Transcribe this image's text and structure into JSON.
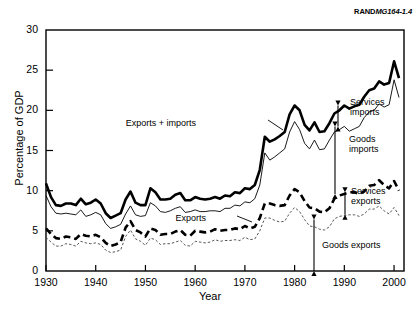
{
  "figure": {
    "source_label": "RANDMG164-1.4",
    "source_label_bold": "RAND",
    "source_label_italic": "MG164-1.4"
  },
  "chart_data": {
    "type": "line",
    "title": "",
    "xlabel": "Year",
    "ylabel": "Percentage of GDP",
    "xlim": [
      1930,
      2002
    ],
    "ylim": [
      0,
      30
    ],
    "yticks": [
      0,
      5,
      10,
      15,
      20,
      25,
      30
    ],
    "xticks": [
      1930,
      1940,
      1950,
      1960,
      1970,
      1980,
      1990,
      2000
    ],
    "ytick_labels": [
      "0",
      "5",
      "10",
      "15",
      "20",
      "25",
      "30"
    ],
    "xtick_labels": [
      "1930",
      "1940",
      "1950",
      "1960",
      "1970",
      "1980",
      "1990",
      "2000"
    ],
    "grid": false,
    "legend_position": "inline-annotations",
    "x": [
      1930,
      1931,
      1932,
      1933,
      1934,
      1935,
      1936,
      1937,
      1938,
      1939,
      1940,
      1941,
      1942,
      1943,
      1944,
      1945,
      1946,
      1947,
      1948,
      1949,
      1950,
      1951,
      1952,
      1953,
      1954,
      1955,
      1956,
      1957,
      1958,
      1959,
      1960,
      1961,
      1962,
      1963,
      1964,
      1965,
      1966,
      1967,
      1968,
      1969,
      1970,
      1971,
      1972,
      1973,
      1974,
      1975,
      1976,
      1977,
      1978,
      1979,
      1980,
      1981,
      1982,
      1983,
      1984,
      1985,
      1986,
      1987,
      1988,
      1989,
      1990,
      1991,
      1992,
      1993,
      1994,
      1995,
      1996,
      1997,
      1998,
      1999,
      2000,
      2001
    ],
    "series": [
      {
        "name": "Exports + imports",
        "style": "thick-solid",
        "color": "#000000",
        "values": [
          10.9,
          9.2,
          8.2,
          8.1,
          8.4,
          8.4,
          8.2,
          9.0,
          8.3,
          8.5,
          8.9,
          8.4,
          7.2,
          6.6,
          6.9,
          7.2,
          8.9,
          9.9,
          8.5,
          8.2,
          8.2,
          10.3,
          9.8,
          8.9,
          8.9,
          9.0,
          9.5,
          9.7,
          8.8,
          8.8,
          9.2,
          9.0,
          8.9,
          9.0,
          9.2,
          9.0,
          9.4,
          9.3,
          9.8,
          9.7,
          10.3,
          10.2,
          10.7,
          12.6,
          16.7,
          16.1,
          16.4,
          16.8,
          17.3,
          19.5,
          20.6,
          20.0,
          18.2,
          17.5,
          18.5,
          17.3,
          17.4,
          18.4,
          19.6,
          20.0,
          20.6,
          20.2,
          20.5,
          20.7,
          21.7,
          22.5,
          22.7,
          23.6,
          23.2,
          23.4,
          26.1,
          24.0
        ]
      },
      {
        "name": "Goods + services imports (upper thin line)",
        "style": "thin-solid",
        "color": "#000000",
        "values": [
          9.4,
          8.0,
          7.2,
          7.1,
          7.2,
          7.1,
          7.0,
          7.6,
          6.8,
          7.0,
          7.3,
          7.0,
          5.9,
          5.3,
          5.5,
          5.8,
          7.1,
          8.1,
          7.0,
          6.8,
          6.9,
          8.5,
          8.1,
          7.4,
          7.3,
          7.5,
          7.8,
          8.0,
          7.3,
          7.4,
          7.6,
          7.4,
          7.4,
          7.5,
          7.5,
          7.4,
          7.8,
          7.8,
          8.2,
          8.1,
          8.6,
          8.5,
          9.0,
          10.7,
          14.7,
          13.8,
          14.2,
          14.7,
          15.2,
          17.3,
          18.6,
          17.6,
          15.9,
          15.2,
          16.3,
          15.1,
          15.2,
          16.3,
          17.3,
          17.6,
          18.0,
          17.4,
          17.7,
          18.0,
          19.1,
          19.8,
          20.0,
          20.8,
          20.4,
          20.7,
          23.8,
          21.6
        ]
      },
      {
        "name": "Exports",
        "style": "thick-dashed",
        "color": "#000000",
        "values": [
          5.3,
          4.6,
          4.1,
          4.0,
          4.3,
          4.2,
          4.0,
          4.6,
          4.4,
          4.3,
          4.5,
          4.2,
          3.5,
          3.1,
          3.3,
          3.6,
          5.4,
          6.2,
          5.1,
          4.8,
          4.3,
          5.3,
          5.1,
          4.5,
          4.6,
          4.6,
          4.9,
          5.1,
          4.5,
          4.4,
          5.0,
          4.9,
          4.8,
          4.9,
          5.2,
          5.0,
          5.1,
          5.1,
          5.3,
          5.2,
          5.6,
          5.3,
          5.5,
          6.6,
          8.4,
          8.4,
          8.2,
          8.1,
          8.2,
          9.4,
          10.2,
          9.8,
          8.7,
          7.9,
          7.8,
          7.4,
          7.3,
          7.8,
          9.0,
          9.4,
          9.6,
          9.8,
          9.8,
          9.6,
          9.9,
          10.6,
          10.7,
          11.3,
          10.7,
          10.3,
          11.2,
          10.0
        ]
      },
      {
        "name": "Goods exports",
        "style": "thin-dotted",
        "color": "#555555",
        "values": [
          4.2,
          3.6,
          3.1,
          3.1,
          3.4,
          3.3,
          3.1,
          3.7,
          3.5,
          3.4,
          3.5,
          3.3,
          2.6,
          2.3,
          2.4,
          2.6,
          4.3,
          5.1,
          4.0,
          3.7,
          3.2,
          4.1,
          3.9,
          3.3,
          3.4,
          3.4,
          3.6,
          3.8,
          3.2,
          3.1,
          3.7,
          3.6,
          3.5,
          3.6,
          3.9,
          3.7,
          3.8,
          3.8,
          3.9,
          3.8,
          4.2,
          3.9,
          4.0,
          5.0,
          6.6,
          6.6,
          6.3,
          6.1,
          6.2,
          7.2,
          7.9,
          7.4,
          6.4,
          5.6,
          5.5,
          5.2,
          5.1,
          5.5,
          6.5,
          6.8,
          6.9,
          7.0,
          7.0,
          6.8,
          7.1,
          7.7,
          7.7,
          8.1,
          7.5,
          7.1,
          7.9,
          6.9
        ]
      }
    ],
    "annotations": [
      {
        "id": "exports-imports",
        "text": "Exports + imports",
        "x": 196,
        "y": 118
      },
      {
        "id": "exports",
        "text": "Exports",
        "x": 206,
        "y": 213
      },
      {
        "id": "services-imports",
        "text": "Services\nimports",
        "line1": "Services",
        "line2": "imports",
        "x": 350,
        "y": 97
      },
      {
        "id": "goods-imports",
        "text": "Goods\nimports",
        "line1": "Goods",
        "line2": "imports",
        "x": 349,
        "y": 134
      },
      {
        "id": "services-exports",
        "text": "Services\nexports",
        "line1": "Services",
        "line2": "exports",
        "x": 351,
        "y": 186
      },
      {
        "id": "goods-exports",
        "text": "Goods exports",
        "line1": "Goods exports",
        "x": 322,
        "y": 240
      }
    ]
  }
}
